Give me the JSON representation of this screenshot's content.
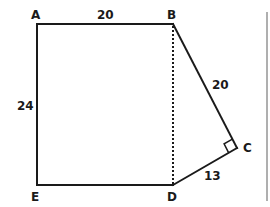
{
  "diagram": {
    "type": "geometry-figure",
    "shape": "pentagon ABCDE composed of rectangle ABDE and triangle BCD",
    "vertices": {
      "A": {
        "label": "A"
      },
      "B": {
        "label": "B"
      },
      "C": {
        "label": "C"
      },
      "D": {
        "label": "D"
      },
      "E": {
        "label": "E"
      }
    },
    "edges": {
      "AB": {
        "length_label": "20"
      },
      "AE": {
        "length_label": "24"
      },
      "BC": {
        "length_label": "20"
      },
      "CD": {
        "length_label": "13"
      },
      "DE": {
        "length_label": ""
      },
      "BD": {
        "style": "dashed",
        "length_label": ""
      }
    },
    "right_angle_marker": "C",
    "colors": {
      "line": "#1a1a1a",
      "border": "#7a7a7a",
      "background": "#ffffff"
    }
  }
}
